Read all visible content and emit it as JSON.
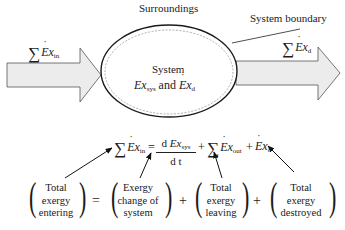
{
  "labels": {
    "surroundings": "Surroundings",
    "system_boundary": "System boundary",
    "system": "System",
    "system_contents": {
      "ex_sys": "Ex",
      "ex_sys_sub": "sys",
      "and": "and",
      "ex_d": "Ex",
      "ex_d_sub": "d"
    }
  },
  "arrows": {
    "input": {
      "sigma": "∑",
      "symbol": "Ex",
      "sub": "in"
    },
    "output": {
      "sigma": "∑",
      "symbol": "Ex",
      "sub": "d"
    }
  },
  "equation": {
    "lhs": {
      "sigma": "∑",
      "symbol": "Ex",
      "sub": "in"
    },
    "equals": "=",
    "fraction": {
      "numerator_d": "d",
      "numerator_symbol": "Ex",
      "numerator_sub": "sys",
      "denominator": "d t"
    },
    "plus1": "+",
    "term_out": {
      "sigma": "∑",
      "symbol": "Ex",
      "sub": "out"
    },
    "plus2": "+",
    "term_d": {
      "symbol": "Ex",
      "sub": "d"
    }
  },
  "word_equation": {
    "groups": [
      {
        "lines": [
          "Total",
          "exergy",
          "entering"
        ]
      },
      {
        "lines": [
          "Exergy",
          "change of",
          "system"
        ]
      },
      {
        "lines": [
          "Total",
          "exergy",
          "leaving"
        ]
      },
      {
        "lines": [
          "Total",
          "exergy",
          "destroyed"
        ]
      }
    ],
    "operators": [
      "=",
      "+",
      "+"
    ]
  },
  "colors": {
    "arrow_fill": "#ececec",
    "arrow_stroke": "#555555",
    "ellipse_stroke": "#1a1a1a",
    "dashed_stroke": "#666666",
    "text": "#1a1a1a"
  }
}
